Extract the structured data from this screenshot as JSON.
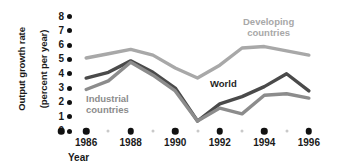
{
  "chart_data": {
    "type": "line",
    "title": "",
    "xlabel": "Year",
    "ylabel": "Output growth rate\n(percent per year)",
    "x": [
      1986,
      1987,
      1988,
      1989,
      1990,
      1991,
      1992,
      1993,
      1994,
      1995,
      1996
    ],
    "xlim": [
      1985.5,
      1996.5
    ],
    "ylim": [
      0,
      8
    ],
    "yticks": [
      0,
      1,
      2,
      3,
      4,
      5,
      6,
      7,
      8
    ],
    "xticks": [
      1986,
      1988,
      1990,
      1992,
      1994,
      1996
    ],
    "xticklabels": [
      "1986",
      "1988",
      "1990",
      "1992",
      "1994",
      "1996"
    ],
    "grid": false,
    "legend_position": "inline-annotations",
    "series": [
      {
        "name": "Developing countries",
        "color": "#a8a8a8",
        "values": [
          5.1,
          5.4,
          5.7,
          5.3,
          4.4,
          3.7,
          4.6,
          5.8,
          5.9,
          5.6,
          5.3
        ]
      },
      {
        "name": "World",
        "color": "#4a4a4a",
        "values": [
          3.7,
          4.1,
          4.9,
          4.1,
          3.0,
          0.7,
          1.9,
          2.4,
          3.1,
          4.0,
          2.8
        ]
      },
      {
        "name": "Industrial countries",
        "color": "#8c8c8c",
        "values": [
          2.9,
          3.5,
          4.8,
          3.9,
          2.8,
          0.7,
          1.6,
          1.2,
          2.5,
          2.6,
          2.3
        ]
      }
    ],
    "annotations": [
      {
        "text": "Developing countries",
        "series": "Developing countries"
      },
      {
        "text": "World",
        "series": "World"
      },
      {
        "text": "Industrial countries",
        "series": "Industrial countries"
      }
    ]
  },
  "axis": {
    "y_title_line1": "Output growth rate",
    "y_title_line2": "(percent per year)",
    "x_title": "Year",
    "y_tick_labels": [
      "8",
      "7",
      "6",
      "5",
      "4",
      "3",
      "2",
      "1",
      "0"
    ],
    "x_tick_labels": [
      "1986",
      "1988",
      "1990",
      "1992",
      "1994",
      "1996"
    ]
  },
  "labels": {
    "developing": "Developing\ncountries",
    "industrial": "Industrial\ncountries",
    "world": "World"
  },
  "colors": {
    "developing": "#a8a8a8",
    "world": "#4a4a4a",
    "industrial": "#8c8c8c",
    "axis_dot_major": "#111111",
    "axis_dot_minor": "#c9c9c9",
    "text": "#1a1a1a",
    "background": "#ffffff"
  }
}
